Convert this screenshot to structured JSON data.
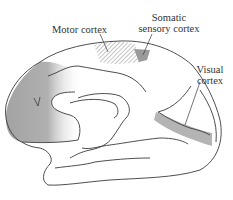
{
  "diagram": {
    "labels": {
      "motor_cortex": "Motor cortex",
      "somatic_sensory_line1": "Somatic",
      "somatic_sensory_line2": "sensory cortex",
      "visual_line1": "Visual",
      "visual_line2": "cortex"
    },
    "colors": {
      "outline": "#3a3a3a",
      "frontal_shade": "#a8a8a8",
      "somatic_fill": "#9a9a9a",
      "visual_band": "#b4b4b4",
      "hatch": "#8a8a8a",
      "text": "#333333"
    }
  }
}
